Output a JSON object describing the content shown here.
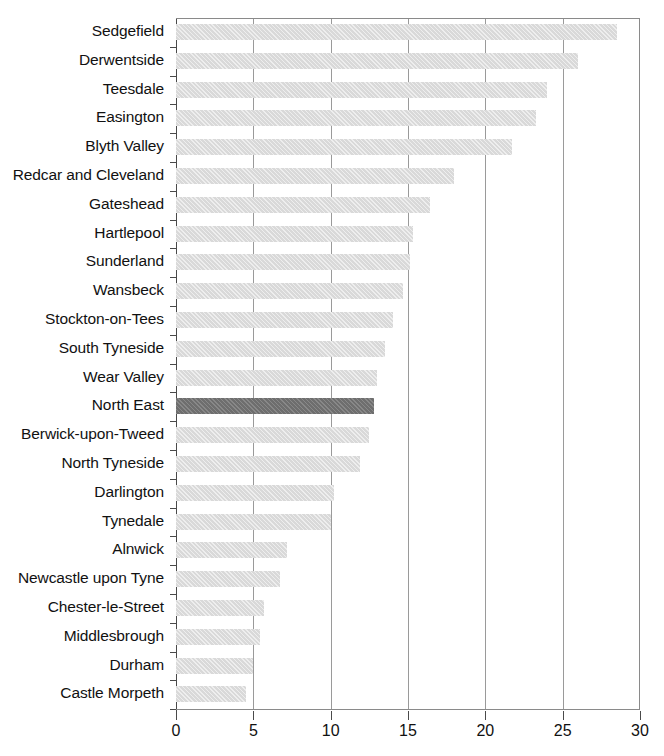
{
  "chart_data": {
    "type": "bar",
    "orientation": "horizontal",
    "title": "",
    "subtitle": "",
    "xlabel": "",
    "ylabel": "",
    "xlim": [
      0,
      30
    ],
    "xticks": [
      0,
      5,
      10,
      15,
      20,
      25,
      30
    ],
    "xtick_labels": [
      "0",
      "5",
      "10",
      "15",
      "20",
      "25",
      "30"
    ],
    "grid": "vertical",
    "legend": "none",
    "highlight_category": "North East",
    "colors": {
      "bar": "#d9d9d9",
      "highlight_bar": "#6e6e6e",
      "axis": "#4a4a4a",
      "gridline": "#9a9a9a",
      "text": "#111111",
      "background": "#ffffff"
    },
    "categories": [
      "Sedgefield",
      "Derwentside",
      "Teesdale",
      "Easington",
      "Blyth Valley",
      "Redcar and Cleveland",
      "Gateshead",
      "Hartlepool",
      "Sunderland",
      "Wansbeck",
      "Stockton-on-Tees",
      "South Tyneside",
      "Wear Valley",
      "North East",
      "Berwick-upon-Tweed",
      "North Tyneside",
      "Darlington",
      "Tynedale",
      "Alnwick",
      "Newcastle upon Tyne",
      "Chester-le-Street",
      "Middlesbrough",
      "Durham",
      "Castle Morpeth"
    ],
    "values": [
      28.5,
      26.0,
      24.0,
      23.3,
      21.7,
      18.0,
      16.4,
      15.3,
      15.1,
      14.7,
      14.0,
      13.5,
      13.0,
      12.8,
      12.5,
      11.9,
      10.2,
      10.0,
      7.2,
      6.7,
      5.7,
      5.4,
      5.0,
      4.5
    ],
    "bars": [
      {
        "label": "Sedgefield",
        "value": 28.5,
        "highlight": false
      },
      {
        "label": "Derwentside",
        "value": 26.0,
        "highlight": false
      },
      {
        "label": "Teesdale",
        "value": 24.0,
        "highlight": false
      },
      {
        "label": "Easington",
        "value": 23.3,
        "highlight": false
      },
      {
        "label": "Blyth Valley",
        "value": 21.7,
        "highlight": false
      },
      {
        "label": "Redcar and Cleveland",
        "value": 18.0,
        "highlight": false
      },
      {
        "label": "Gateshead",
        "value": 16.4,
        "highlight": false
      },
      {
        "label": "Hartlepool",
        "value": 15.3,
        "highlight": false
      },
      {
        "label": "Sunderland",
        "value": 15.1,
        "highlight": false
      },
      {
        "label": "Wansbeck",
        "value": 14.7,
        "highlight": false
      },
      {
        "label": "Stockton-on-Tees",
        "value": 14.0,
        "highlight": false
      },
      {
        "label": "South Tyneside",
        "value": 13.5,
        "highlight": false
      },
      {
        "label": "Wear Valley",
        "value": 13.0,
        "highlight": false
      },
      {
        "label": "North East",
        "value": 12.8,
        "highlight": true
      },
      {
        "label": "Berwick-upon-Tweed",
        "value": 12.5,
        "highlight": false
      },
      {
        "label": "North Tyneside",
        "value": 11.9,
        "highlight": false
      },
      {
        "label": "Darlington",
        "value": 10.2,
        "highlight": false
      },
      {
        "label": "Tynedale",
        "value": 10.0,
        "highlight": false
      },
      {
        "label": "Alnwick",
        "value": 7.2,
        "highlight": false
      },
      {
        "label": "Newcastle upon Tyne",
        "value": 6.7,
        "highlight": false
      },
      {
        "label": "Chester-le-Street",
        "value": 5.7,
        "highlight": false
      },
      {
        "label": "Middlesbrough",
        "value": 5.4,
        "highlight": false
      },
      {
        "label": "Durham",
        "value": 5.0,
        "highlight": false
      },
      {
        "label": "Castle Morpeth",
        "value": 4.5,
        "highlight": false
      }
    ]
  }
}
